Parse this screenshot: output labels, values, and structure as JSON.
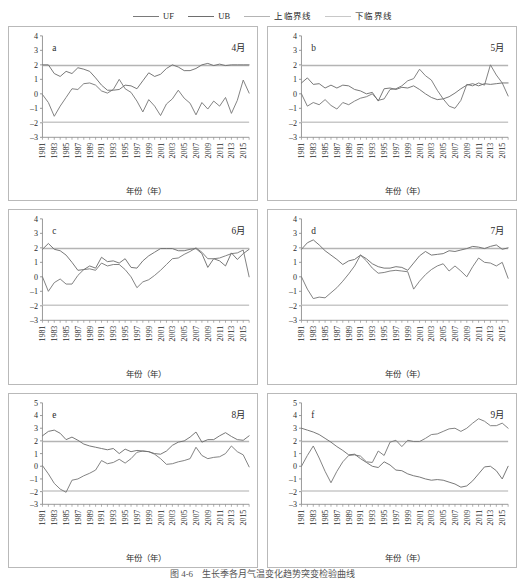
{
  "legend": {
    "items": [
      {
        "label": "UF",
        "color": "#7a7a7a"
      },
      {
        "label": "UB",
        "color": "#6e6e6e"
      },
      {
        "label": "上临界线",
        "color": "#b4b4b4"
      },
      {
        "label": "下临界线",
        "color": "#c8c8c8"
      }
    ]
  },
  "caption": {
    "text": "图 4-6　生长季各月气温变化趋势突变检验曲线"
  },
  "axis": {
    "xlabel": "年份（年）",
    "xticks": [
      "1981",
      "1983",
      "1985",
      "1987",
      "1989",
      "1991",
      "1993",
      "1995",
      "1997",
      "1999",
      "2001",
      "2003",
      "2005",
      "2007",
      "2009",
      "2011",
      "2013",
      "2015"
    ],
    "x_start": 1981,
    "x_end": 2016,
    "critical_upper": 1.96,
    "critical_lower": -1.96
  },
  "colors": {
    "uf_line": "#7a7a7a",
    "ub_line": "#6e6e6e",
    "critical_upper": "#b4b4b4",
    "critical_lower": "#c8c8c8",
    "axis": "#8c8c8c",
    "text": "#2b2b2b",
    "panel_border": "#b9b9b9"
  },
  "chart_data": [
    {
      "type": "line",
      "panel": "a",
      "title": "4月",
      "xlabel": "年份（年）",
      "ylabel": "",
      "xlim": [
        1981,
        2016
      ],
      "ylim": [
        -3,
        4
      ],
      "yticks": [
        -3,
        -2,
        -1,
        0,
        1,
        2,
        3,
        4
      ],
      "grid": false,
      "legend_position": "top-center-shared",
      "x": [
        1981,
        1982,
        1983,
        1984,
        1985,
        1986,
        1987,
        1988,
        1989,
        1990,
        1991,
        1992,
        1993,
        1994,
        1995,
        1996,
        1997,
        1998,
        1999,
        2000,
        2001,
        2002,
        2003,
        2004,
        2005,
        2006,
        2007,
        2008,
        2009,
        2010,
        2011,
        2012,
        2013,
        2014,
        2015,
        2016
      ],
      "series": [
        {
          "name": "UF",
          "values": [
            -0.05,
            -0.6,
            -1.55,
            -0.85,
            -0.25,
            0.35,
            0.3,
            0.7,
            0.75,
            0.6,
            0.2,
            0.05,
            0.3,
            1.0,
            0.35,
            0.1,
            -0.5,
            -1.25,
            -0.4,
            -0.85,
            -1.5,
            -0.7,
            -0.35,
            0.25,
            -0.3,
            -0.65,
            -1.45,
            -0.6,
            -1.05,
            -0.5,
            -0.85,
            -0.25,
            -1.35,
            -0.45,
            0.95,
            0.05
          ]
        },
        {
          "name": "UB",
          "values": [
            2.0,
            2.0,
            1.4,
            1.2,
            1.55,
            1.4,
            1.8,
            1.7,
            1.55,
            1.1,
            0.6,
            0.25,
            0.25,
            0.3,
            0.6,
            0.55,
            0.35,
            0.9,
            1.45,
            1.2,
            1.35,
            1.75,
            2.0,
            1.85,
            1.6,
            1.6,
            1.75,
            2.0,
            2.1,
            1.95,
            2.05,
            1.95,
            2.0,
            2.0,
            2.0,
            2.0
          ]
        }
      ]
    },
    {
      "type": "line",
      "panel": "b",
      "title": "5月",
      "xlabel": "年份（年）",
      "ylabel": "",
      "xlim": [
        1981,
        2016
      ],
      "ylim": [
        -3,
        4
      ],
      "yticks": [
        -3,
        -2,
        -1,
        0,
        1,
        2,
        3,
        4
      ],
      "grid": false,
      "legend_position": "top-center-shared",
      "x": [
        1981,
        1982,
        1983,
        1984,
        1985,
        1986,
        1987,
        1988,
        1989,
        1990,
        1991,
        1992,
        1993,
        1994,
        1995,
        1996,
        1997,
        1998,
        1999,
        2000,
        2001,
        2002,
        2003,
        2004,
        2005,
        2006,
        2007,
        2008,
        2009,
        2010,
        2011,
        2012,
        2013,
        2014,
        2015,
        2016
      ],
      "series": [
        {
          "name": "UF",
          "values": [
            0.0,
            -0.85,
            -0.6,
            -0.75,
            -0.4,
            -0.8,
            -1.05,
            -0.6,
            -0.75,
            -0.5,
            -0.3,
            -0.2,
            0.0,
            -0.45,
            -0.35,
            0.3,
            0.35,
            0.55,
            0.9,
            1.05,
            1.7,
            1.25,
            0.95,
            0.25,
            -0.35,
            -0.85,
            -1.0,
            -0.45,
            0.65,
            0.55,
            0.75,
            0.6,
            2.0,
            1.3,
            0.75,
            -0.15
          ]
        },
        {
          "name": "UB",
          "values": [
            0.75,
            1.1,
            0.65,
            0.7,
            0.4,
            0.6,
            0.4,
            0.6,
            0.55,
            0.3,
            0.2,
            0.0,
            0.1,
            -0.5,
            0.35,
            0.4,
            0.3,
            0.45,
            0.4,
            0.55,
            0.3,
            0.0,
            -0.25,
            -0.4,
            -0.35,
            -0.2,
            0.05,
            0.35,
            0.6,
            0.7,
            0.55,
            0.7,
            0.65,
            0.7,
            0.75,
            0.75
          ]
        }
      ]
    },
    {
      "type": "line",
      "panel": "c",
      "title": "6月",
      "xlabel": "年份（年）",
      "ylabel": "",
      "xlim": [
        1981,
        2016
      ],
      "ylim": [
        -3,
        4
      ],
      "yticks": [
        -3,
        -2,
        -1,
        0,
        1,
        2,
        3,
        4
      ],
      "grid": false,
      "legend_position": "top-center-shared",
      "x": [
        1981,
        1982,
        1983,
        1984,
        1985,
        1986,
        1987,
        1988,
        1989,
        1990,
        1991,
        1992,
        1993,
        1994,
        1995,
        1996,
        1997,
        1998,
        1999,
        2000,
        2001,
        2002,
        2003,
        2004,
        2005,
        2006,
        2007,
        2008,
        2009,
        2010,
        2011,
        2012,
        2013,
        2014,
        2015,
        2016
      ],
      "series": [
        {
          "name": "UF",
          "values": [
            0.0,
            -1.0,
            -0.4,
            -0.15,
            -0.5,
            -0.5,
            0.1,
            0.5,
            0.55,
            0.45,
            0.95,
            0.75,
            0.85,
            0.85,
            0.5,
            0.0,
            -0.75,
            -0.35,
            -0.2,
            0.1,
            0.45,
            0.85,
            1.25,
            1.3,
            1.55,
            1.75,
            2.0,
            1.7,
            1.25,
            1.25,
            1.3,
            1.45,
            1.6,
            1.65,
            1.85,
            0.0
          ]
        },
        {
          "name": "UB",
          "values": [
            1.9,
            2.3,
            1.9,
            1.8,
            1.5,
            1.0,
            0.45,
            0.5,
            0.75,
            0.6,
            1.35,
            1.05,
            1.1,
            0.95,
            1.25,
            0.65,
            0.6,
            1.1,
            1.45,
            1.7,
            1.95,
            1.95,
            1.95,
            1.8,
            1.8,
            1.9,
            1.95,
            1.6,
            0.65,
            1.25,
            1.1,
            0.75,
            1.65,
            1.2,
            1.6,
            1.9
          ]
        }
      ]
    },
    {
      "type": "line",
      "panel": "d",
      "title": "7月",
      "xlabel": "年份（年）",
      "ylabel": "",
      "xlim": [
        1981,
        2016
      ],
      "ylim": [
        -3,
        4
      ],
      "yticks": [
        -3,
        -2,
        -1,
        0,
        1,
        2,
        3,
        4
      ],
      "grid": false,
      "legend_position": "top-center-shared",
      "x": [
        1981,
        1982,
        1983,
        1984,
        1985,
        1986,
        1987,
        1988,
        1989,
        1990,
        1991,
        1992,
        1993,
        1994,
        1995,
        1996,
        1997,
        1998,
        1999,
        2000,
        2001,
        2002,
        2003,
        2004,
        2005,
        2006,
        2007,
        2008,
        2009,
        2010,
        2011,
        2012,
        2013,
        2014,
        2015,
        2016
      ],
      "series": [
        {
          "name": "UF",
          "values": [
            0.0,
            -0.85,
            -1.5,
            -1.4,
            -1.45,
            -1.1,
            -0.75,
            -0.3,
            0.2,
            0.75,
            1.5,
            1.1,
            0.6,
            0.25,
            0.3,
            0.4,
            0.45,
            0.4,
            0.35,
            -0.85,
            -0.3,
            0.15,
            0.5,
            0.75,
            0.9,
            0.4,
            0.75,
            0.4,
            0.0,
            0.7,
            1.3,
            1.0,
            0.95,
            0.75,
            1.0,
            -0.1
          ]
        },
        {
          "name": "UB",
          "values": [
            1.9,
            2.35,
            2.55,
            2.2,
            1.8,
            1.5,
            1.2,
            0.85,
            1.1,
            1.2,
            1.5,
            1.25,
            0.9,
            0.7,
            0.6,
            0.6,
            0.7,
            0.65,
            0.45,
            0.95,
            1.45,
            1.75,
            1.5,
            1.55,
            1.6,
            1.8,
            1.75,
            1.85,
            1.95,
            2.1,
            2.05,
            1.95,
            2.1,
            2.2,
            1.9,
            2.0
          ]
        }
      ]
    },
    {
      "type": "line",
      "panel": "e",
      "title": "8月",
      "xlabel": "年份（年）",
      "ylabel": "",
      "xlim": [
        1981,
        2016
      ],
      "ylim": [
        -3,
        5
      ],
      "yticks": [
        -3,
        -2,
        -1,
        0,
        1,
        2,
        3,
        4,
        5
      ],
      "grid": false,
      "legend_position": "top-center-shared",
      "x": [
        1981,
        1982,
        1983,
        1984,
        1985,
        1986,
        1987,
        1988,
        1989,
        1990,
        1991,
        1992,
        1993,
        1994,
        1995,
        1996,
        1997,
        1998,
        1999,
        2000,
        2001,
        2002,
        2003,
        2004,
        2005,
        2006,
        2007,
        2008,
        2009,
        2010,
        2011,
        2012,
        2013,
        2014,
        2015,
        2016
      ],
      "series": [
        {
          "name": "UF",
          "values": [
            0.05,
            -0.6,
            -1.35,
            -1.8,
            -2.05,
            -1.1,
            -1.0,
            -0.75,
            -0.55,
            -0.3,
            0.45,
            0.2,
            0.3,
            0.55,
            0.25,
            0.6,
            1.1,
            1.2,
            1.15,
            0.95,
            0.6,
            0.15,
            0.2,
            0.35,
            0.45,
            0.6,
            1.5,
            0.85,
            0.6,
            0.7,
            0.75,
            1.0,
            1.6,
            1.15,
            0.9,
            -0.05
          ]
        },
        {
          "name": "UB",
          "values": [
            2.4,
            2.75,
            2.85,
            2.6,
            2.1,
            2.3,
            2.05,
            1.75,
            1.6,
            1.5,
            1.4,
            1.3,
            1.4,
            1.0,
            1.35,
            1.15,
            1.25,
            1.2,
            1.15,
            1.0,
            0.95,
            1.2,
            1.65,
            1.9,
            2.0,
            2.3,
            2.7,
            1.9,
            2.1,
            2.1,
            2.4,
            2.65,
            2.35,
            2.1,
            2.05,
            2.4
          ]
        }
      ]
    },
    {
      "type": "line",
      "panel": "f",
      "title": "9月",
      "xlabel": "年份（年）",
      "ylabel": "",
      "xlim": [
        1981,
        2016
      ],
      "ylim": [
        -3,
        5
      ],
      "yticks": [
        -3,
        -2,
        -1,
        0,
        1,
        2,
        3,
        4,
        5
      ],
      "grid": false,
      "legend_position": "top-center-shared",
      "x": [
        1981,
        1982,
        1983,
        1984,
        1985,
        1986,
        1987,
        1988,
        1989,
        1990,
        1991,
        1992,
        1993,
        1994,
        1995,
        1996,
        1997,
        1998,
        1999,
        2000,
        2001,
        2002,
        2003,
        2004,
        2005,
        2006,
        2007,
        2008,
        2009,
        2010,
        2011,
        2012,
        2013,
        2014,
        2015,
        2016
      ],
      "series": [
        {
          "name": "UF",
          "values": [
            0.0,
            0.85,
            1.6,
            0.65,
            -0.4,
            -1.3,
            -0.4,
            0.35,
            0.85,
            0.9,
            0.8,
            0.35,
            0.3,
            1.2,
            0.85,
            1.9,
            2.05,
            1.55,
            2.05,
            1.95,
            1.95,
            2.2,
            2.5,
            2.55,
            2.75,
            2.95,
            3.0,
            2.75,
            3.0,
            3.4,
            3.75,
            3.55,
            3.2,
            3.2,
            3.4,
            3.0
          ]
        },
        {
          "name": "UB",
          "values": [
            3.0,
            2.85,
            2.7,
            2.5,
            2.2,
            1.9,
            1.55,
            1.25,
            0.9,
            0.95,
            0.6,
            0.3,
            0.0,
            -0.1,
            0.35,
            0.1,
            -0.3,
            -0.35,
            -0.6,
            -0.75,
            -0.85,
            -1.0,
            -1.1,
            -1.05,
            -1.1,
            -1.25,
            -1.4,
            -1.65,
            -1.55,
            -1.15,
            -0.6,
            -0.05,
            0.0,
            -0.35,
            -1.0,
            0.0
          ]
        }
      ]
    }
  ]
}
